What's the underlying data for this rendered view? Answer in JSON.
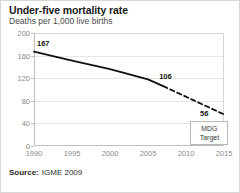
{
  "header": {
    "title": "Under-five mortality rate",
    "subtitle": "Deaths per 1,000 live births"
  },
  "footer": {
    "source_label": "Source:",
    "source_value": "IGME 2009"
  },
  "annotations": {
    "mdg_line1": "MDG",
    "mdg_line2": "Target"
  },
  "chart_data": {
    "type": "line",
    "title": "Under-five mortality rate",
    "subtitle": "Deaths per 1,000 live births",
    "xlabel": "",
    "ylabel": "Deaths per 1,000 live births",
    "xlim": [
      1990,
      2015
    ],
    "ylim": [
      0,
      200
    ],
    "yticks": [
      0,
      40,
      80,
      120,
      160,
      200
    ],
    "xticks": [
      1990,
      1995,
      2000,
      2005,
      2010,
      2015
    ],
    "grid": "horizontal",
    "legend": "none",
    "series": [
      {
        "name": "Observed",
        "style": "solid",
        "x": [
          1990,
          1995,
          2000,
          2005,
          2007
        ],
        "values": [
          167,
          151,
          136,
          118,
          106
        ]
      },
      {
        "name": "Projected to MDG target",
        "style": "dashed",
        "x": [
          2007,
          2015
        ],
        "values": [
          106,
          56
        ]
      }
    ],
    "point_labels": [
      {
        "x": 1990,
        "value": 167,
        "text": "167"
      },
      {
        "x": 2007,
        "value": 106,
        "text": "106"
      },
      {
        "x": 2015,
        "value": 56,
        "text": "56"
      }
    ],
    "annotations": [
      {
        "text": "MDG Target",
        "x": 2014,
        "y": 30
      }
    ]
  }
}
